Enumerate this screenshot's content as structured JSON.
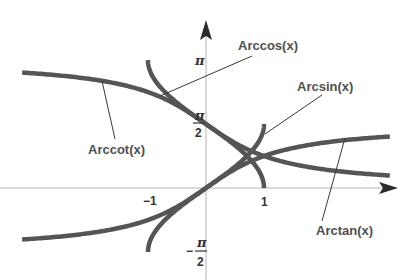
{
  "chart_data": {
    "type": "line",
    "title": "",
    "xlabel": "",
    "ylabel": "",
    "xlim": [
      -3.17,
      3.17
    ],
    "ylim": [
      -1.571,
      3.1416
    ],
    "grid": false,
    "legend": "none (curves labeled with leader lines)",
    "x_ticks": [
      {
        "value": -1,
        "label": "−1"
      },
      {
        "value": 1,
        "label": "1"
      }
    ],
    "y_ticks": [
      {
        "value": 3.1416,
        "label": "π"
      },
      {
        "value": 1.5708,
        "label": "π/2"
      },
      {
        "value": -1.5708,
        "label": "−π/2"
      }
    ],
    "series": [
      {
        "name": "Arcsin(x)",
        "function": "arcsin",
        "domain": [
          -1,
          1
        ],
        "range": [
          -1.5708,
          1.5708
        ]
      },
      {
        "name": "Arccos(x)",
        "function": "arccos",
        "domain": [
          -1,
          1
        ],
        "range": [
          0,
          3.1416
        ]
      },
      {
        "name": "Arctan(x)",
        "function": "arctan",
        "domain": [
          -3.17,
          3.17
        ],
        "range": [
          -1.265,
          1.265
        ]
      },
      {
        "name": "Arccot(x)",
        "function": "arccot",
        "domain": [
          -3.17,
          3.17
        ],
        "range": [
          0.306,
          2.836
        ]
      }
    ],
    "annotations": [
      {
        "text": "Arccos(x)",
        "points_to": "Arccos(x)"
      },
      {
        "text": "Arcsin(x)",
        "points_to": "Arcsin(x)"
      },
      {
        "text": "Arccot(x)",
        "points_to": "Arccot(x)"
      },
      {
        "text": "Arctan(x)",
        "points_to": "Arctan(x)"
      }
    ]
  },
  "labels": {
    "arccos": "Arccos(x)",
    "arcsin": "Arcsin(x)",
    "arccot": "Arccot(x)",
    "arctan": "Arctan(x)",
    "x_neg1": "−1",
    "x_pos1": "1",
    "pi": "π",
    "pi_half_num": "π",
    "pi_half_den": "2",
    "neg_sign": "−",
    "neg_pi_half_num": "π",
    "neg_pi_half_den": "2"
  },
  "style": {
    "curve_color": "#555555",
    "axis_color": "#b4b4b4",
    "label_color": "#505050"
  }
}
